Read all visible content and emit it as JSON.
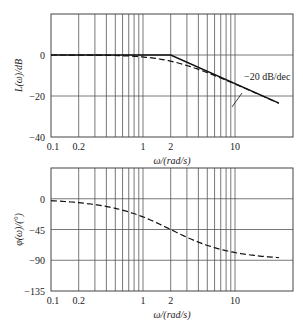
{
  "chart_data": [
    {
      "type": "line",
      "name": "magnitude",
      "title": "",
      "xlabel": "ω/(rad/s)",
      "ylabel": "L(ω)/dB",
      "xscale": "log",
      "xlim": [
        0.1,
        30
      ],
      "ylim": [
        -40,
        20
      ],
      "grid": true,
      "x_tick_labels": [
        "0.1",
        "0.2",
        "1",
        "2",
        "10"
      ],
      "x_ticks": [
        0.1,
        0.2,
        1,
        2,
        10
      ],
      "y_tick_labels": [
        "0",
        "−20",
        "−40"
      ],
      "y_ticks": [
        0,
        -20,
        -40
      ],
      "corner_frequency": 2,
      "annotation": "−20 dB/dec",
      "series": [
        {
          "name": "asymptote",
          "style": "solid",
          "x": [
            0.1,
            2,
            30
          ],
          "values": [
            0,
            0,
            -23.5
          ]
        },
        {
          "name": "exact",
          "style": "dashed",
          "x": [
            0.1,
            0.2,
            0.5,
            1,
            2,
            3,
            5,
            10,
            20,
            30
          ],
          "values": [
            -0.01,
            -0.04,
            -0.26,
            -0.97,
            -3.01,
            -5.12,
            -8.6,
            -14.15,
            -20.04,
            -23.54
          ]
        }
      ]
    },
    {
      "type": "line",
      "name": "phase",
      "title": "",
      "xlabel": "ω/(rad/s)",
      "ylabel": "φ(ω)/(°)",
      "xscale": "log",
      "xlim": [
        0.1,
        30
      ],
      "ylim": [
        -135,
        45
      ],
      "grid": true,
      "x_tick_labels": [
        "0.1",
        "0.2",
        "1",
        "2",
        "10"
      ],
      "x_ticks": [
        0.1,
        0.2,
        1,
        2,
        10
      ],
      "y_tick_labels": [
        "0",
        "−45",
        "−90",
        "−135"
      ],
      "y_ticks": [
        0,
        -45,
        -90,
        -135
      ],
      "series": [
        {
          "name": "phase",
          "style": "dashed",
          "x": [
            0.1,
            0.2,
            0.5,
            1,
            2,
            3,
            5,
            10,
            20,
            30
          ],
          "values": [
            -2.9,
            -5.7,
            -14.0,
            -26.6,
            -45.0,
            -56.3,
            -68.2,
            -78.7,
            -84.3,
            -86.2
          ]
        }
      ]
    }
  ],
  "labels": {
    "top_ylabel": "L(ω)/dB",
    "bottom_ylabel": "φ(ω)/(°)",
    "xlabel": "ω/(rad/s)",
    "slope": "−20 dB/dec"
  }
}
